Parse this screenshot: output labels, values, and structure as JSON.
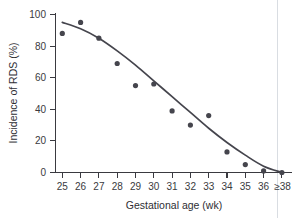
{
  "chart_data": {
    "type": "scatter",
    "title": "",
    "xlabel": "Gestational age (wk)",
    "ylabel": "Incidence of RDS (%)",
    "categories": [
      "25",
      "26",
      "27",
      "28",
      "29",
      "30",
      "31",
      "32",
      "33",
      "34",
      "35",
      "36",
      "≥38"
    ],
    "values": [
      88,
      95,
      85,
      69,
      55,
      56,
      39,
      30,
      36,
      13,
      5,
      1,
      0
    ],
    "series": [
      {
        "name": "Incidence of RDS",
        "values": [
          88,
          95,
          85,
          69,
          55,
          56,
          39,
          30,
          36,
          13,
          5,
          1,
          0
        ]
      },
      {
        "name": "Fitted curve",
        "values": [
          95,
          91,
          85,
          77,
          68,
          58,
          48,
          38,
          28,
          19,
          11,
          4,
          0
        ]
      }
    ],
    "ylim": [
      0,
      100
    ],
    "yticks": [
      "0",
      "20",
      "40",
      "60",
      "80",
      "100"
    ],
    "xticks": [
      "25",
      "26",
      "27",
      "28",
      "29",
      "30",
      "31",
      "32",
      "33",
      "34",
      "35",
      "36",
      "≥38"
    ],
    "grid": false,
    "legend": "none",
    "marker_color": "#45454d",
    "curve_color": "#45454d",
    "axis_color": "#3a3a40",
    "background_color": "#ffffff"
  }
}
